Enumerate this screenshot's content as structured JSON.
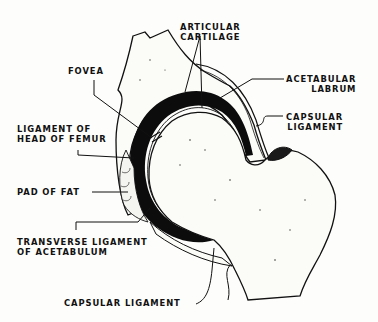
{
  "diagram": {
    "labels": {
      "articular_cartilage": [
        "ARTICULAR",
        "CARTILAGE"
      ],
      "fovea": "FOVEA",
      "acetabular_labrum": [
        "ACETABULAR",
        "LABRUM"
      ],
      "capsular_ligament_upper": [
        "CAPSULAR",
        "LIGAMENT"
      ],
      "ligament_head_femur": [
        "LIGAMENT OF",
        "HEAD OF FEMUR"
      ],
      "pad_of_fat": "PAD OF FAT",
      "transverse_ligament": [
        "TRANSVERSE LIGAMENT",
        "OF ACETABULUM"
      ],
      "capsular_ligament_lower": "CAPSULAR LIGAMENT"
    },
    "colors": {
      "ink": "#111111",
      "paper": "#fdfdfb"
    }
  }
}
